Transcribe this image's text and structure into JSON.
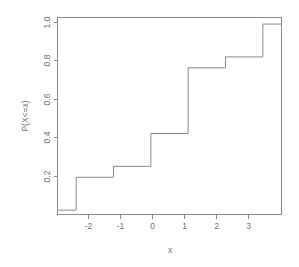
{
  "chart_data": {
    "type": "line",
    "subtype": "step-ecdf",
    "title": "",
    "xlabel": "x",
    "ylabel": "P(X<=x)",
    "xlim": [
      -2.5,
      3.5
    ],
    "ylim": [
      0.13,
      1.03
    ],
    "grid": false,
    "legend": null,
    "xticks": [
      -2,
      -1,
      0,
      1,
      2,
      3
    ],
    "xticklabels": [
      "-2",
      "-1",
      "0",
      "1",
      "2",
      "3"
    ],
    "yticks": [
      0.2,
      0.4,
      0.6,
      0.8,
      1.0
    ],
    "yticklabels": [
      "0.2",
      "0.4",
      "0.6",
      "0.8",
      "1.0"
    ],
    "jump_points": [
      -2,
      -1,
      0,
      1,
      2,
      3
    ],
    "step_levels": [
      0.15,
      0.3,
      0.35,
      0.5,
      0.8,
      0.85,
      1.0
    ],
    "steps": [
      {
        "x_start": -2.5,
        "x_end": -2.0,
        "y": 0.15
      },
      {
        "x_start": -2.0,
        "x_end": -1.0,
        "y": 0.3
      },
      {
        "x_start": -1.0,
        "x_end": 0.0,
        "y": 0.35
      },
      {
        "x_start": 0.0,
        "x_end": 1.0,
        "y": 0.5
      },
      {
        "x_start": 1.0,
        "x_end": 2.0,
        "y": 0.8
      },
      {
        "x_start": 2.0,
        "x_end": 3.0,
        "y": 0.85
      },
      {
        "x_start": 3.0,
        "x_end": 3.5,
        "y": 1.0
      }
    ],
    "probabilities": [
      {
        "x": -2,
        "p": 0.15
      },
      {
        "x": -1,
        "p": 0.05
      },
      {
        "x": 0,
        "p": 0.15
      },
      {
        "x": 1,
        "p": 0.3
      },
      {
        "x": 2,
        "p": 0.05
      },
      {
        "x": 3,
        "p": 0.15
      }
    ],
    "line_color": "#8a8a8a",
    "background_color": "#ffffff"
  }
}
